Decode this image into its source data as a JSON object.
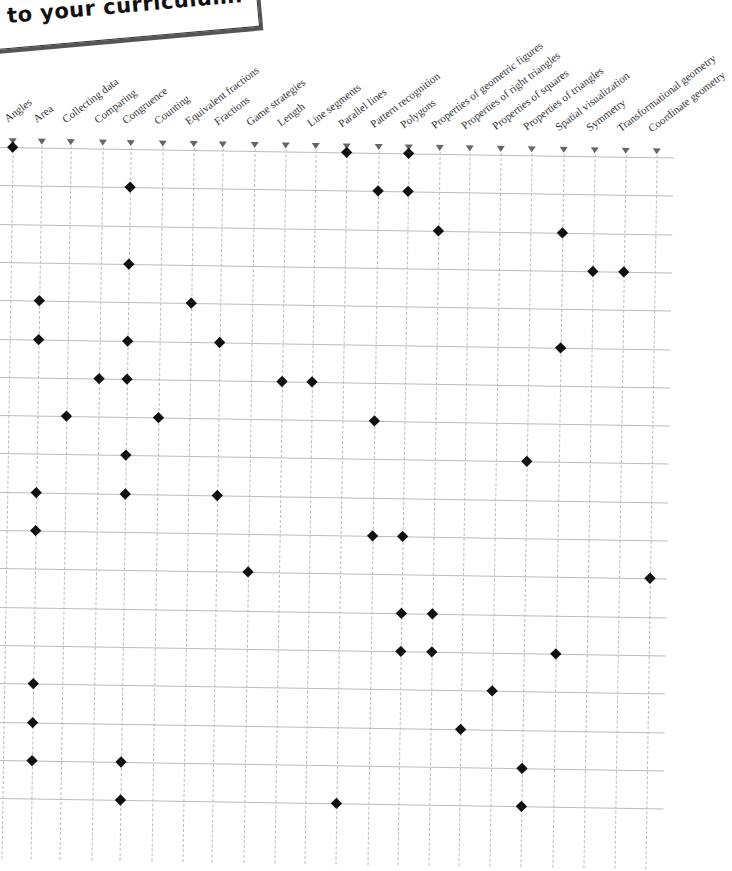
{
  "callout": {
    "line1": "the Simple",
    "line2": "to your curriculum."
  },
  "columns": [
    {
      "label": "Angles",
      "x": 15
    },
    {
      "label": "Area",
      "x": 44
    },
    {
      "label": "Collecting data",
      "x": 73
    },
    {
      "label": "Comparing",
      "x": 105
    },
    {
      "label": "Congruence",
      "x": 133
    },
    {
      "label": "Counting",
      "x": 165
    },
    {
      "label": "Equivalent fractions",
      "x": 196
    },
    {
      "label": "Fractions",
      "x": 225
    },
    {
      "label": "Game strategies",
      "x": 257
    },
    {
      "label": "Length",
      "x": 288
    },
    {
      "label": "Line segments",
      "x": 318
    },
    {
      "label": "Parallel lines",
      "x": 349
    },
    {
      "label": "Pattern recognition",
      "x": 381
    },
    {
      "label": "Polygons",
      "x": 411
    },
    {
      "label": "Properties of geometric figures",
      "x": 442
    },
    {
      "label": "Properties of right triangles",
      "x": 472
    },
    {
      "label": "Properties of squares",
      "x": 503
    },
    {
      "label": "Properties of triangles",
      "x": 534
    },
    {
      "label": "Spatial visualization",
      "x": 566
    },
    {
      "label": "Symmetry",
      "x": 597
    },
    {
      "label": "Transformational geometry",
      "x": 628
    },
    {
      "label": "Coordinate geometry",
      "x": 659
    }
  ],
  "rows": [
    {
      "marks": [
        "Angles",
        "Parallel lines",
        "Polygons"
      ]
    },
    {
      "marks": [
        "Congruence",
        "Pattern recognition",
        "Polygons"
      ]
    },
    {
      "marks": [
        "Properties of geometric figures",
        "Spatial visualization"
      ]
    },
    {
      "marks": [
        "Congruence",
        "Symmetry",
        "Transformational geometry"
      ]
    },
    {
      "marks": [
        "Area",
        "Equivalent fractions"
      ]
    },
    {
      "marks": [
        "Area",
        "Congruence",
        "Fractions",
        "Spatial visualization"
      ]
    },
    {
      "marks": [
        "Comparing",
        "Congruence",
        "Length",
        "Line segments"
      ]
    },
    {
      "marks": [
        "Collecting data",
        "Counting",
        "Pattern recognition"
      ]
    },
    {
      "marks": [
        "Congruence",
        "Properties of triangles"
      ]
    },
    {
      "marks": [
        "Area",
        "Congruence",
        "Fractions"
      ]
    },
    {
      "marks": [
        "Area",
        "Pattern recognition",
        "Polygons"
      ]
    },
    {
      "marks": [
        "Game strategies",
        "Coordinate geometry"
      ]
    },
    {
      "marks": [
        "Polygons",
        "Properties of geometric figures"
      ]
    },
    {
      "marks": [
        "Polygons",
        "Properties of geometric figures",
        "Spatial visualization"
      ]
    },
    {
      "marks": [
        "Area",
        "Properties of squares"
      ]
    },
    {
      "marks": [
        "Area",
        "Properties of right triangles"
      ]
    },
    {
      "marks": [
        "Area",
        "Congruence",
        "Properties of triangles"
      ]
    },
    {
      "marks": [
        "Congruence",
        "Parallel lines",
        "Properties of triangles"
      ]
    }
  ],
  "grid": {
    "top": 147,
    "row_spacing": 38.3,
    "right_edge": 676,
    "marker_y": 142
  }
}
